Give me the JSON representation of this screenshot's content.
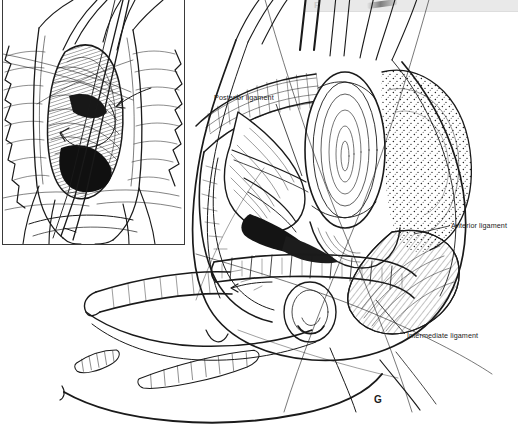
{
  "figure": {
    "panel_letter_current": "G",
    "panel_letter_previous": "F",
    "background_color": "#ffffff",
    "ink_color": "#1a1a1a",
    "strip_color": "#e9e9e9"
  },
  "labels": {
    "posterior_ligament": "Posterior ligament",
    "anterior_ligament": "Anterior ligament",
    "intermediate_ligament": "Intermediate ligament"
  },
  "inset": {
    "title": "",
    "description": "operative-field-inset"
  }
}
